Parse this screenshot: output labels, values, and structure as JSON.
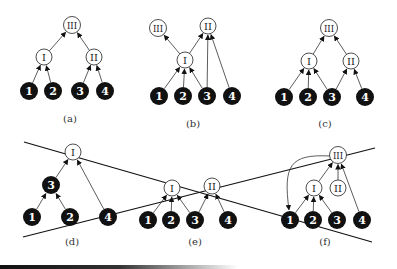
{
  "figure": {
    "colors": {
      "black_node": "#111111",
      "white_node": "#ffffff",
      "edge": "#333333",
      "text_on_black": "#ffffff",
      "text_on_white": "#222222"
    },
    "panels": [
      {
        "id": "a",
        "caption": "(a)",
        "nodes": [
          {
            "id": "1",
            "label": "1",
            "type": "black",
            "x": 29,
            "y": 91
          },
          {
            "id": "2",
            "label": "2",
            "type": "black",
            "x": 53,
            "y": 91
          },
          {
            "id": "3",
            "label": "3",
            "type": "black",
            "x": 80,
            "y": 91
          },
          {
            "id": "4",
            "label": "4",
            "type": "black",
            "x": 105,
            "y": 91
          },
          {
            "id": "I",
            "label": "I",
            "type": "white",
            "x": 44,
            "y": 57
          },
          {
            "id": "II",
            "label": "II",
            "type": "white",
            "x": 94,
            "y": 57
          },
          {
            "id": "III",
            "label": "III",
            "type": "white",
            "x": 72,
            "y": 25
          }
        ],
        "edges": [
          [
            "1",
            "I"
          ],
          [
            "2",
            "I"
          ],
          [
            "3",
            "II"
          ],
          [
            "4",
            "II"
          ],
          [
            "I",
            "III"
          ],
          [
            "II",
            "III"
          ]
        ]
      },
      {
        "id": "b",
        "caption": "(b)",
        "nodes": [
          {
            "id": "1",
            "label": "1",
            "type": "black",
            "x": 159,
            "y": 96
          },
          {
            "id": "2",
            "label": "2",
            "type": "black",
            "x": 183,
            "y": 96
          },
          {
            "id": "3",
            "label": "3",
            "type": "black",
            "x": 207,
            "y": 96
          },
          {
            "id": "4",
            "label": "4",
            "type": "black",
            "x": 232,
            "y": 96
          },
          {
            "id": "I",
            "label": "I",
            "type": "white",
            "x": 185,
            "y": 60
          },
          {
            "id": "II",
            "label": "II",
            "type": "white",
            "x": 208,
            "y": 26
          },
          {
            "id": "III",
            "label": "III",
            "type": "white",
            "x": 158,
            "y": 28
          }
        ],
        "edges": [
          [
            "1",
            "I"
          ],
          [
            "2",
            "I"
          ],
          [
            "3",
            "I"
          ],
          [
            "3",
            "II"
          ],
          [
            "4",
            "II"
          ],
          [
            "I",
            "II"
          ],
          [
            "I",
            "III"
          ]
        ]
      },
      {
        "id": "c",
        "caption": "(c)",
        "nodes": [
          {
            "id": "1",
            "label": "1",
            "type": "black",
            "x": 284,
            "y": 97
          },
          {
            "id": "2",
            "label": "2",
            "type": "black",
            "x": 308,
            "y": 97
          },
          {
            "id": "3",
            "label": "3",
            "type": "black",
            "x": 332,
            "y": 97
          },
          {
            "id": "4",
            "label": "4",
            "type": "black",
            "x": 365,
            "y": 97
          },
          {
            "id": "I",
            "label": "I",
            "type": "white",
            "x": 309,
            "y": 61
          },
          {
            "id": "II",
            "label": "II",
            "type": "white",
            "x": 351,
            "y": 61
          },
          {
            "id": "III",
            "label": "III",
            "type": "white",
            "x": 329,
            "y": 28
          }
        ],
        "edges": [
          [
            "1",
            "I"
          ],
          [
            "2",
            "I"
          ],
          [
            "3",
            "I"
          ],
          [
            "3",
            "II"
          ],
          [
            "4",
            "II"
          ],
          [
            "I",
            "III"
          ],
          [
            "II",
            "III"
          ]
        ]
      },
      {
        "id": "d",
        "caption": "(d)",
        "nodes": [
          {
            "id": "1",
            "label": "1",
            "type": "black",
            "x": 32,
            "y": 217
          },
          {
            "id": "2",
            "label": "2",
            "type": "black",
            "x": 70,
            "y": 217
          },
          {
            "id": "3",
            "label": "3",
            "type": "black",
            "x": 51,
            "y": 185
          },
          {
            "id": "4",
            "label": "4",
            "type": "black",
            "x": 108,
            "y": 217
          },
          {
            "id": "I",
            "label": "I",
            "type": "white",
            "x": 73,
            "y": 152
          }
        ],
        "edges": [
          [
            "1",
            "3"
          ],
          [
            "2",
            "3"
          ],
          [
            "3",
            "I"
          ],
          [
            "4",
            "I"
          ]
        ]
      },
      {
        "id": "e",
        "caption": "(e)",
        "nodes": [
          {
            "id": "1",
            "label": "1",
            "type": "black",
            "x": 148,
            "y": 220
          },
          {
            "id": "2",
            "label": "2",
            "type": "black",
            "x": 171,
            "y": 220
          },
          {
            "id": "3",
            "label": "3",
            "type": "black",
            "x": 195,
            "y": 220
          },
          {
            "id": "4",
            "label": "4",
            "type": "black",
            "x": 228,
            "y": 220
          },
          {
            "id": "I",
            "label": "I",
            "type": "white",
            "x": 172,
            "y": 188
          },
          {
            "id": "II",
            "label": "II",
            "type": "white",
            "x": 212,
            "y": 186
          }
        ],
        "edges": [
          [
            "1",
            "I"
          ],
          [
            "2",
            "I"
          ],
          [
            "3",
            "I"
          ],
          [
            "3",
            "II"
          ],
          [
            "4",
            "II"
          ]
        ]
      },
      {
        "id": "f",
        "caption": "(f)",
        "nodes": [
          {
            "id": "1",
            "label": "1",
            "type": "black",
            "x": 290,
            "y": 220
          },
          {
            "id": "2",
            "label": "2",
            "type": "black",
            "x": 313,
            "y": 220
          },
          {
            "id": "3",
            "label": "3",
            "type": "black",
            "x": 337,
            "y": 220
          },
          {
            "id": "4",
            "label": "4",
            "type": "black",
            "x": 362,
            "y": 220
          },
          {
            "id": "I",
            "label": "I",
            "type": "white",
            "x": 314,
            "y": 188
          },
          {
            "id": "II",
            "label": "II",
            "type": "white",
            "x": 338,
            "y": 188
          },
          {
            "id": "III",
            "label": "III",
            "type": "white",
            "x": 338,
            "y": 155
          }
        ],
        "edges": [
          [
            "1",
            "I"
          ],
          [
            "2",
            "I"
          ],
          [
            "3",
            "I"
          ],
          [
            "I",
            "III"
          ],
          [
            "II",
            "III"
          ],
          [
            "4",
            "III"
          ]
        ],
        "curved_edges": [
          [
            "III",
            "1"
          ]
        ]
      }
    ],
    "captions_pos": {
      "a": {
        "x": 70,
        "y": 122
      },
      "b": {
        "x": 193,
        "y": 127
      },
      "c": {
        "x": 325,
        "y": 127
      },
      "d": {
        "x": 72,
        "y": 245
      },
      "e": {
        "x": 195,
        "y": 245
      },
      "f": {
        "x": 325,
        "y": 245
      }
    },
    "cut_lines": [
      {
        "x1": 24,
        "y1": 142,
        "x2": 372,
        "y2": 242
      },
      {
        "x1": 23,
        "y1": 237,
        "x2": 375,
        "y2": 148
      }
    ]
  }
}
